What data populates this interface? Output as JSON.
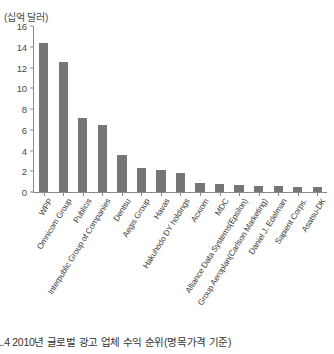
{
  "chart_data": {
    "type": "bar",
    "title": "",
    "unit_label": "(십억 달러)",
    "xlabel": "",
    "ylabel": "",
    "ylim": [
      0,
      16
    ],
    "yticks": [
      0,
      2,
      4,
      6,
      8,
      10,
      12,
      14,
      16
    ],
    "grid": false,
    "legend": null,
    "bar_color": "#767676",
    "axis_color": "#8a8a8a",
    "categories": [
      "WPP",
      "Omnicom Group",
      "Publicis",
      "Interpublic Group of Companies",
      "Dentsu",
      "Aegis Group",
      "Havas",
      "Hakuhodo DY holdings",
      "Acxiom",
      "MDC",
      "Alliance Data Systems(Epsilon)",
      "Group Aeroplan(Carlson Marketing)",
      "Daniel J. Edelman",
      "Sapient Corps.",
      "Asatsu-DK"
    ],
    "values": [
      14.4,
      12.5,
      7.1,
      6.5,
      3.6,
      2.3,
      2.1,
      1.8,
      0.85,
      0.75,
      0.65,
      0.6,
      0.55,
      0.5,
      0.45
    ]
  },
  "caption": {
    "text": "1.4 2010년 글로벌 광고 업체 수익 순위(명목가격 기준)"
  }
}
